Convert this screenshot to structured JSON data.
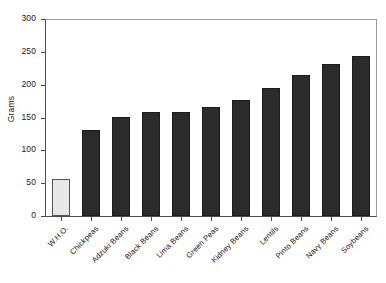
{
  "chart_data": {
    "type": "bar",
    "title": "",
    "xlabel": "",
    "ylabel": "Grams",
    "ylim": [
      0,
      300
    ],
    "yticks": [
      0,
      50,
      100,
      150,
      200,
      250,
      300
    ],
    "grid": false,
    "legend": "none",
    "categories": [
      "W.H.O.",
      "Chickpeas",
      "Adzuki Beans",
      "Black Beans",
      "Lima Beans",
      "Green Peas",
      "Kidney Beans",
      "Lentils",
      "Pinto Beans",
      "Navy Beans",
      "Soybeans"
    ],
    "values": [
      56,
      131,
      151,
      158,
      159,
      166,
      177,
      195,
      214,
      231,
      243
    ],
    "bar_styles": [
      "light",
      "dark",
      "dark",
      "dark",
      "dark",
      "dark",
      "dark",
      "dark",
      "dark",
      "dark",
      "dark"
    ],
    "colors": {
      "bar_dark": "#2b2b2b",
      "bar_light": "#e8e8e8",
      "axis": "#4d4d4d",
      "text": "#111111",
      "background": "#ffffff"
    }
  }
}
